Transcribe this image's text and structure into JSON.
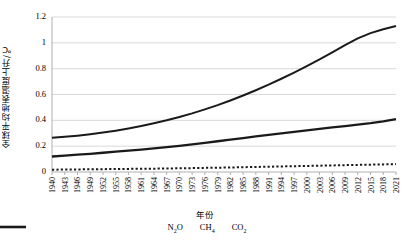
{
  "chart_data": {
    "type": "line",
    "title": "",
    "xlabel": "年份",
    "ylabel": "全球平均地表温度上升/℃",
    "ylim": [
      0,
      1.2
    ],
    "xlim": [
      1940,
      2021
    ],
    "grid": true,
    "legend_position": "bottom",
    "ytick_labels": [
      "1.2",
      "1",
      "0.8",
      "0.6",
      "0.4",
      "0.2",
      "0"
    ],
    "ytick_values": [
      1.2,
      1.0,
      0.8,
      0.6,
      0.4,
      0.2,
      0
    ],
    "categories": [
      1940,
      1943,
      1946,
      1949,
      1952,
      1955,
      1958,
      1961,
      1964,
      1967,
      1970,
      1973,
      1976,
      1979,
      1982,
      1985,
      1988,
      1991,
      1994,
      1997,
      2000,
      2003,
      2006,
      2009,
      2012,
      2015,
      2018,
      2021
    ],
    "xtick_labels": [
      "1940",
      "1943",
      "1946",
      "1949",
      "1952",
      "1955",
      "1958",
      "1961",
      "1964",
      "1967",
      "1970",
      "1973",
      "1976",
      "1979",
      "1982",
      "1985",
      "1988",
      "1991",
      "1994",
      "1997",
      "2000",
      "2003",
      "2006",
      "2009",
      "2012",
      "2015",
      "2018",
      "2021"
    ],
    "series": [
      {
        "name": "N₂O",
        "legend_label_main": "N",
        "legend_sub_1": "2",
        "legend_label_tail": "O",
        "style": "dotted",
        "color": "#1a1a1a",
        "values": [
          0.018,
          0.019,
          0.02,
          0.021,
          0.022,
          0.023,
          0.024,
          0.025,
          0.026,
          0.027,
          0.029,
          0.03,
          0.032,
          0.033,
          0.035,
          0.037,
          0.039,
          0.041,
          0.043,
          0.045,
          0.047,
          0.049,
          0.051,
          0.053,
          0.055,
          0.057,
          0.059,
          0.061
        ]
      },
      {
        "name": "CH₄",
        "legend_label_main": "CH",
        "legend_sub_1": "4",
        "legend_label_tail": "",
        "style": "solid-thick",
        "color": "#1a1a1a",
        "values": [
          0.12,
          0.127,
          0.134,
          0.141,
          0.149,
          0.157,
          0.165,
          0.174,
          0.183,
          0.193,
          0.203,
          0.214,
          0.226,
          0.238,
          0.25,
          0.263,
          0.275,
          0.287,
          0.299,
          0.311,
          0.323,
          0.334,
          0.345,
          0.356,
          0.367,
          0.378,
          0.392,
          0.41
        ]
      },
      {
        "name": "CO₂",
        "legend_label_main": "CO",
        "legend_sub_1": "2",
        "legend_label_tail": "",
        "style": "solid",
        "color": "#1a1a1a",
        "values": [
          0.265,
          0.272,
          0.281,
          0.292,
          0.305,
          0.32,
          0.337,
          0.356,
          0.377,
          0.4,
          0.426,
          0.454,
          0.485,
          0.518,
          0.554,
          0.592,
          0.633,
          0.676,
          0.722,
          0.77,
          0.82,
          0.872,
          0.926,
          0.982,
          1.035,
          1.075,
          1.105,
          1.13
        ]
      }
    ]
  }
}
